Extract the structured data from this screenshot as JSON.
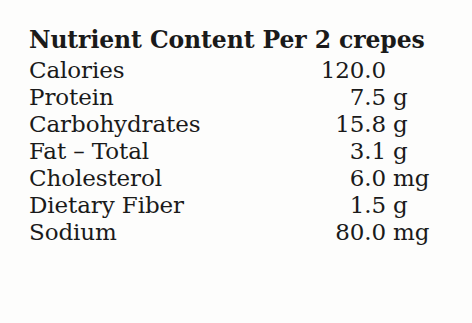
{
  "panel": {
    "title": "Nutrient Content Per 2 crepes",
    "background_color": "#fdfdfc",
    "text_color": "#1a1a1a",
    "rows": [
      {
        "label": "Calories",
        "value": "120.0",
        "unit": ""
      },
      {
        "label": "Protein",
        "value": "7.5",
        "unit": "g"
      },
      {
        "label": "Carbohydrates",
        "value": "15.8",
        "unit": "g"
      },
      {
        "label": "Fat – Total",
        "value": "3.1",
        "unit": "g"
      },
      {
        "label": "Cholesterol",
        "value": "6.0",
        "unit": "mg"
      },
      {
        "label": "Dietary Fiber",
        "value": "1.5",
        "unit": "g"
      },
      {
        "label": "Sodium",
        "value": "80.0",
        "unit": "mg"
      }
    ]
  }
}
